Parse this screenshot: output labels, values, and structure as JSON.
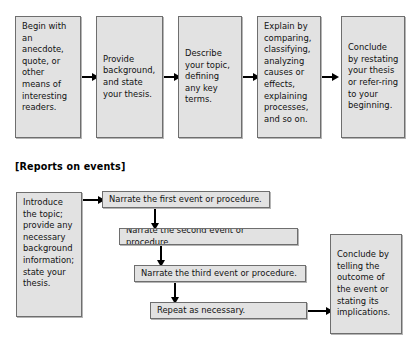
{
  "document": {
    "type": "flowchart-figure",
    "background_color": "#ffffff",
    "box_fill_color": "#e2e2e2",
    "box_border_color": "#6e6e6e",
    "arrow_color": "#000000",
    "text_color": "#111111"
  },
  "top_chart": {
    "name": "explanatory-essay-flow",
    "orientation": "horizontal",
    "boxes": [
      {
        "id": "begin",
        "text": "Begin with an anecdote, quote, or other means of interesting readers."
      },
      {
        "id": "background",
        "text": "Provide background, and state your thesis."
      },
      {
        "id": "describe",
        "text": "Describe your topic, defining any key terms."
      },
      {
        "id": "explain",
        "text": "Explain by comparing, classifying, analyzing causes or effects, explaining processes, and so on."
      },
      {
        "id": "conclude",
        "text": "Conclude by restating your thesis or refer-ring to your beginning."
      }
    ],
    "arrow_count": 4
  },
  "section_heading": {
    "label": "[Reports on events]"
  },
  "bottom_chart": {
    "name": "reports-on-events-flow",
    "orientation": "mixed",
    "boxes": [
      {
        "id": "introduce",
        "text": "Introduce the topic; provide any necessary background information; state your thesis."
      },
      {
        "id": "first-event",
        "text": "Narrate the first event or procedure."
      },
      {
        "id": "second-event",
        "text": "Narrate the second event or procedure."
      },
      {
        "id": "third-event",
        "text": "Narrate the third event or procedure."
      },
      {
        "id": "repeat",
        "text": "Repeat as necessary."
      },
      {
        "id": "conclude-report",
        "text": "Conclude by telling the outcome of the event or stating its implications."
      }
    ],
    "arrow_count": 5
  }
}
